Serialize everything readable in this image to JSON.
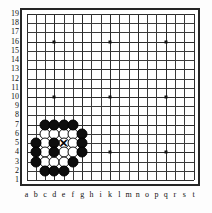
{
  "board": {
    "title": "Go board diagram",
    "size": 19,
    "column_labels": [
      "a",
      "b",
      "c",
      "d",
      "e",
      "f",
      "g",
      "h",
      "i",
      "k",
      "l",
      "m",
      "n",
      "o",
      "p",
      "q",
      "r",
      "s",
      "t"
    ],
    "row_labels": [
      "19",
      "18",
      "17",
      "16",
      "15",
      "14",
      "13",
      "12",
      "11",
      "10",
      "9",
      "8",
      "7",
      "6",
      "5",
      "4",
      "3",
      "2",
      "1"
    ],
    "colors": {
      "black_stone": "#0d0d0d",
      "white_stone": "#ffffff",
      "grid_line": "#3a3a3a",
      "border": "#262626",
      "background": "#ffffff",
      "label_text": "#111111"
    },
    "star_points": [
      {
        "col": "d",
        "row": 16
      },
      {
        "col": "k",
        "row": 16
      },
      {
        "col": "q",
        "row": 16
      },
      {
        "col": "d",
        "row": 10
      },
      {
        "col": "k",
        "row": 10
      },
      {
        "col": "q",
        "row": 10
      },
      {
        "col": "d",
        "row": 4
      },
      {
        "col": "k",
        "row": 4
      },
      {
        "col": "q",
        "row": 4
      }
    ],
    "black_stones": [
      {
        "col": "c",
        "row": 7
      },
      {
        "col": "d",
        "row": 7
      },
      {
        "col": "e",
        "row": 7
      },
      {
        "col": "f",
        "row": 7
      },
      {
        "col": "g",
        "row": 6
      },
      {
        "col": "b",
        "row": 5
      },
      {
        "col": "d",
        "row": 5
      },
      {
        "col": "g",
        "row": 5
      },
      {
        "col": "b",
        "row": 4
      },
      {
        "col": "d",
        "row": 4
      },
      {
        "col": "g",
        "row": 4
      },
      {
        "col": "b",
        "row": 3
      },
      {
        "col": "f",
        "row": 3
      },
      {
        "col": "c",
        "row": 2
      },
      {
        "col": "d",
        "row": 2
      },
      {
        "col": "e",
        "row": 2
      }
    ],
    "white_stones": [
      {
        "col": "c",
        "row": 6
      },
      {
        "col": "d",
        "row": 6
      },
      {
        "col": "e",
        "row": 6
      },
      {
        "col": "f",
        "row": 6
      },
      {
        "col": "c",
        "row": 5
      },
      {
        "col": "e",
        "row": 5
      },
      {
        "col": "f",
        "row": 5
      },
      {
        "col": "c",
        "row": 4
      },
      {
        "col": "e",
        "row": 4
      },
      {
        "col": "f",
        "row": 4
      },
      {
        "col": "c",
        "row": 3
      },
      {
        "col": "d",
        "row": 3
      },
      {
        "col": "e",
        "row": 3
      }
    ],
    "marked_points": [
      {
        "col": "e",
        "row": 5,
        "mark": "x-mark",
        "glyph": "✕"
      }
    ]
  }
}
